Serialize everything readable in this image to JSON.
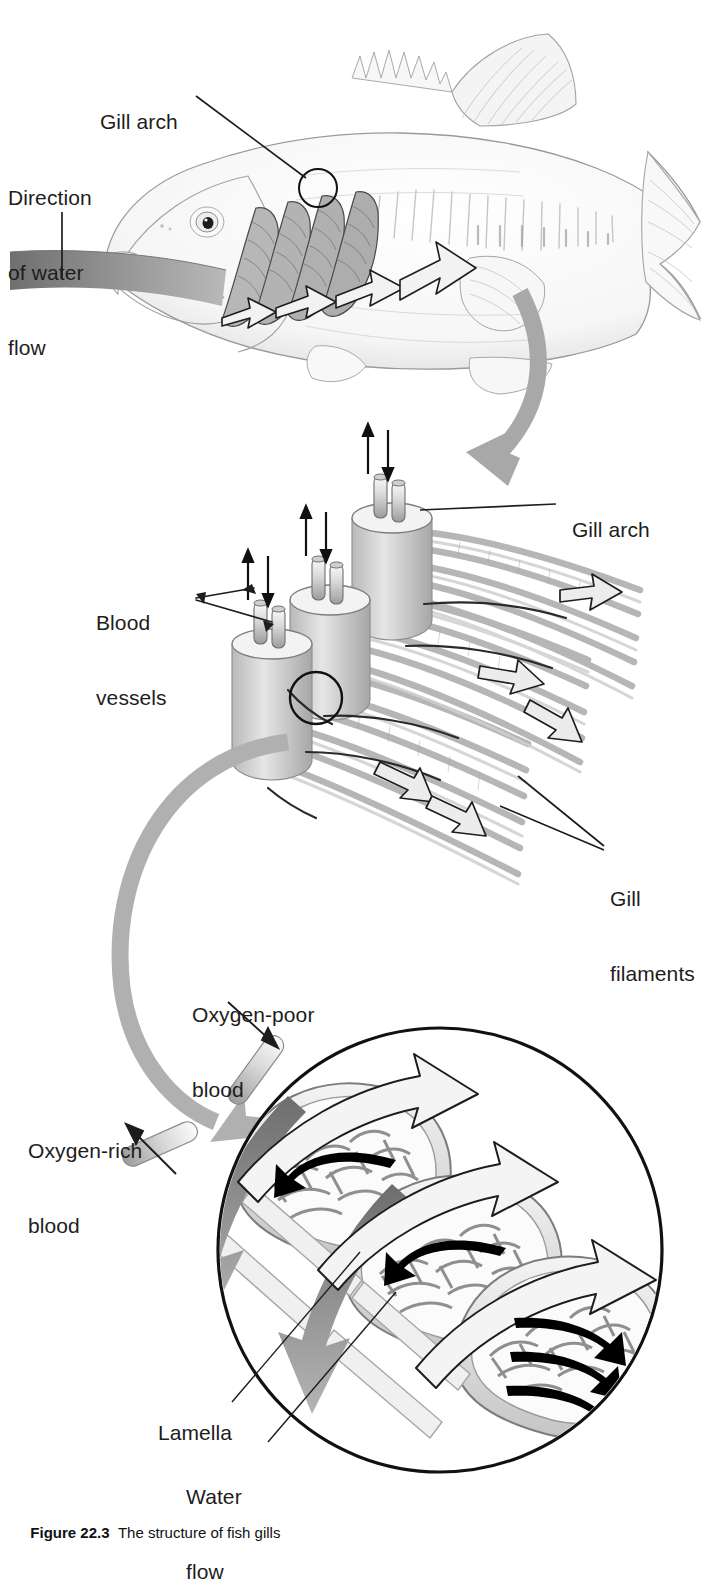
{
  "figure": {
    "domain": "biology-diagram",
    "caption_number": "Figure 22.3",
    "caption_text": "The structure of fish gills",
    "background_color": "#ffffff",
    "ink_color": "#1d1d1d",
    "pencil_gray": "#9a9a9a",
    "arrow_gray": "#9e9e9e",
    "water_band_gray": "#8a8a8a"
  },
  "panels": [
    {
      "id": "panel-fish",
      "name": "whole-fish-overview",
      "description": "Pencil-sketch lateral view of a bass with operculum removed, showing gill arches and water flowing in through the mouth and out past the gills"
    },
    {
      "id": "panel-gill-arches",
      "name": "gill-arch-detail",
      "description": "Three gill arches in perspective, each topped by paired blood vessels, with gill filaments fanning outward and water flowing between them"
    },
    {
      "id": "panel-lamellae",
      "name": "lamella-detail-circle",
      "description": "Circular magnified inset of three lamellae with capillary beds; water flows one way while blood flows the opposite way (countercurrent exchange)"
    }
  ],
  "labels": [
    {
      "id": "gill-arch-top",
      "name": "label-gill-arch-fish",
      "text": "Gill arch",
      "lines": [
        "Gill arch"
      ],
      "x": 88,
      "y": 84,
      "panel": "panel-fish"
    },
    {
      "id": "direction-water",
      "name": "label-direction-of-water-flow",
      "text": "Direction of water flow",
      "lines": [
        "Direction",
        "of water",
        "flow"
      ],
      "x": 8,
      "y": 135,
      "panel": "panel-fish"
    },
    {
      "id": "gill-arch-mid",
      "name": "label-gill-arch-detail",
      "text": "Gill arch",
      "lines": [
        "Gill arch"
      ],
      "x": 560,
      "y": 492,
      "panel": "panel-gill-arches"
    },
    {
      "id": "blood-vessels",
      "name": "label-blood-vessels",
      "text": "Blood vessels",
      "lines": [
        "Blood",
        "vessels"
      ],
      "x": 96,
      "y": 560,
      "panel": "panel-gill-arches"
    },
    {
      "id": "gill-filaments",
      "name": "label-gill-filaments",
      "text": "Gill filaments",
      "lines": [
        "Gill",
        "filaments"
      ],
      "x": 610,
      "y": 836,
      "panel": "panel-gill-arches"
    },
    {
      "id": "oxygen-poor",
      "name": "label-oxygen-poor-blood",
      "text": "Oxygen-poor blood",
      "lines": [
        "Oxygen-poor",
        "blood"
      ],
      "x": 192,
      "y": 952,
      "panel": "panel-lamellae"
    },
    {
      "id": "oxygen-rich",
      "name": "label-oxygen-rich-blood",
      "text": "Oxygen-rich blood",
      "lines": [
        "Oxygen-rich",
        "blood"
      ],
      "x": 28,
      "y": 1088,
      "panel": "panel-lamellae"
    },
    {
      "id": "lamella",
      "name": "label-lamella",
      "text": "Lamella",
      "lines": [
        "Lamella"
      ],
      "x": 146,
      "y": 1395,
      "panel": "panel-lamellae"
    },
    {
      "id": "water-flow-bot",
      "name": "label-water-flow",
      "text": "Water flow",
      "lines": [
        "Water",
        "flow"
      ],
      "x": 186,
      "y": 1434,
      "panel": "panel-lamellae"
    }
  ],
  "arrows": [
    {
      "name": "water-inflow-band",
      "kind": "gradient-band",
      "color": "#8a8a8a",
      "meaning": "water entering the mouth"
    },
    {
      "name": "water-exit-arrow-large",
      "kind": "outline-arrow",
      "color": "#ffffff",
      "meaning": "water exiting past the gills"
    },
    {
      "name": "zoom-arrow-fish-to-arch",
      "kind": "curved-gray-arrow",
      "color": "#a8a8a8",
      "meaning": "magnify gill arch region"
    },
    {
      "name": "zoom-arrow-arch-to-lamella",
      "kind": "curved-gray-arrow",
      "color": "#a8a8a8",
      "meaning": "magnify single filament region"
    },
    {
      "name": "blood-in-arrow",
      "kind": "gray-flat-arrow",
      "color": "#8d8d8d",
      "meaning": "oxygen-poor blood in"
    },
    {
      "name": "blood-out-arrow",
      "kind": "gray-flat-arrow",
      "color": "#8d8d8d",
      "meaning": "oxygen-rich blood out"
    },
    {
      "name": "capillary-flow-arrow",
      "kind": "black-curved-arrow",
      "color": "#000000",
      "meaning": "blood direction through lamella capillaries"
    },
    {
      "name": "vessel-up-arrow",
      "kind": "thin-black-arrow",
      "color": "#111111",
      "meaning": "blood flow up the gill arch vessel"
    },
    {
      "name": "vessel-down-arrow",
      "kind": "thin-black-arrow",
      "color": "#111111",
      "meaning": "blood flow down the gill arch vessel"
    }
  ]
}
